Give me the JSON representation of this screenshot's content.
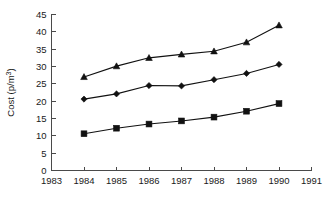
{
  "chart_data": {
    "type": "line",
    "title": "",
    "subtitle": "",
    "xlabel": "",
    "ylabel": "Cost (p/m3)",
    "ylabel_parts": {
      "base": "Cost (p/m",
      "sup": "3",
      "tail": ")"
    },
    "x": [
      1984,
      1985,
      1986,
      1987,
      1988,
      1989,
      1990
    ],
    "xlim": [
      1983,
      1991
    ],
    "ylim": [
      0,
      45
    ],
    "x_tick_labels": [
      "1983",
      "1984",
      "1985",
      "1986",
      "1987",
      "1988",
      "1989",
      "1990",
      "1991"
    ],
    "x_ticks": [
      1983,
      1984,
      1985,
      1986,
      1987,
      1988,
      1989,
      1990,
      1991
    ],
    "y_tick_labels": [
      "0",
      "5",
      "10",
      "15",
      "20",
      "25",
      "30",
      "35",
      "40",
      "45"
    ],
    "y_ticks": [
      0,
      5,
      10,
      15,
      20,
      25,
      30,
      35,
      40,
      45
    ],
    "grid": false,
    "legend": "none",
    "series": [
      {
        "name": "Upper series",
        "marker": "triangle",
        "color": "#111111",
        "values": [
          27.0,
          30.1,
          32.5,
          33.5,
          34.4,
          37.0,
          41.9
        ]
      },
      {
        "name": "Middle series",
        "marker": "diamond",
        "color": "#111111",
        "values": [
          20.6,
          22.1,
          24.5,
          24.4,
          26.2,
          28.0,
          30.6
        ]
      },
      {
        "name": "Lower series",
        "marker": "square",
        "color": "#111111",
        "values": [
          10.6,
          12.2,
          13.4,
          14.3,
          15.4,
          17.1,
          19.3
        ]
      }
    ]
  },
  "axis_colors": {
    "axis": "#4a4a4a",
    "line": "#111111",
    "text": "#1a1a1a",
    "background": "#ffffff"
  }
}
